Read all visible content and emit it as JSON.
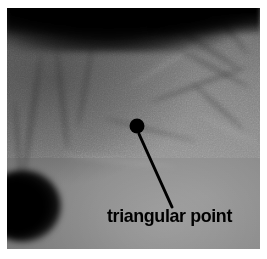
{
  "figure": {
    "kind": "annotated-grayscale-photograph",
    "width": 267,
    "height": 259,
    "background_color": "#ffffff",
    "plate": {
      "left": 7,
      "top": 8,
      "width": 253,
      "height": 241,
      "description": "grayscale medical image with dark band across the top and a large dark oval region at the left"
    }
  },
  "annotation": {
    "label": "triangular point",
    "label_color": "#000000",
    "marker": {
      "name": "triangular-point-marker",
      "shape": "filled-circle",
      "color": "#000000",
      "center_x": 137,
      "center_y": 126,
      "radius": 7
    },
    "leader_line": {
      "color": "#000000",
      "width": 3,
      "x1": 139,
      "y1": 134,
      "x2": 172,
      "y2": 207
    }
  },
  "palette": {
    "tissue_light": "#949494",
    "tissue_mid": "#7d7d7d",
    "tissue_dark": "#636363",
    "shadow": "#000000",
    "border": "#ffffff"
  }
}
